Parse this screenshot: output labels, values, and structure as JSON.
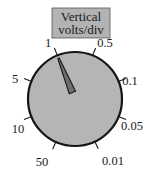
{
  "figure": {
    "name": "vertical-volts-per-div-dial",
    "background_color": "#ffffff",
    "width": 160,
    "height": 176
  },
  "caption": {
    "line1": "Vertical",
    "line2": "volts/div",
    "box_fill": "#b3b3b3",
    "box_stroke": "#4d4d4d",
    "text_color": "#1a1a1a"
  },
  "dial": {
    "fill": "#b5b5b5",
    "stroke": "#151515",
    "center_x": 75,
    "center_y": 99,
    "radius": 47,
    "stroke_width": 2.2
  },
  "pointer": {
    "fill": "#6e6e6e",
    "stroke": "#1a1a1a",
    "selected_value": "1",
    "angle_degrees": 112
  },
  "ticks": [
    {
      "label": "1",
      "angle_degrees": 112,
      "label_x": 48,
      "label_y": 47,
      "anchor": "middle"
    },
    {
      "label": "0.5",
      "angle_degrees": 68,
      "label_x": 105,
      "label_y": 47,
      "anchor": "middle"
    },
    {
      "label": "0.1",
      "angle_degrees": 22,
      "label_x": 130,
      "label_y": 85,
      "anchor": "middle"
    },
    {
      "label": "0.05",
      "angle_degrees": -22,
      "label_x": 132,
      "label_y": 130,
      "anchor": "middle"
    },
    {
      "label": "0.01",
      "angle_degrees": -65,
      "label_x": 113,
      "label_y": 165,
      "anchor": "middle"
    },
    {
      "label": "50",
      "angle_degrees": -114,
      "label_x": 42,
      "label_y": 166,
      "anchor": "middle"
    },
    {
      "label": "10",
      "angle_degrees": -158,
      "label_x": 18,
      "label_y": 133,
      "anchor": "middle"
    },
    {
      "label": "5",
      "angle_degrees": 158,
      "label_x": 15,
      "label_y": 83,
      "anchor": "middle"
    }
  ]
}
